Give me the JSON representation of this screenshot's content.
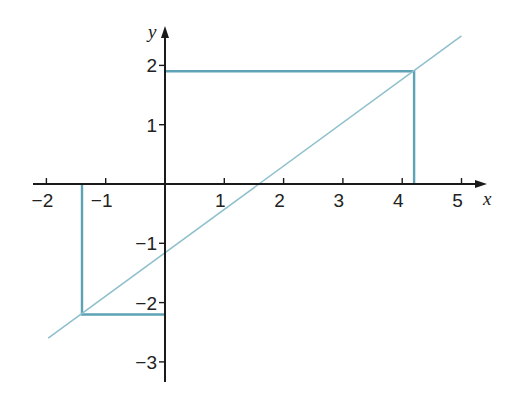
{
  "chart_data": {
    "type": "line",
    "title": "",
    "xlabel": "x",
    "ylabel": "y",
    "xlim": [
      -2.2,
      5.4
    ],
    "ylim": [
      -3.3,
      2.6
    ],
    "grid": false,
    "legend": null,
    "x_ticks": [
      -2,
      -1,
      1,
      2,
      3,
      4,
      5
    ],
    "x_tick_labels": [
      "−2",
      "−1",
      "1",
      "2",
      "3",
      "4",
      "5"
    ],
    "y_ticks": [
      2,
      1,
      -1,
      -2,
      -3
    ],
    "y_tick_labels": [
      "2",
      "1",
      "−1",
      "−2",
      "−3"
    ],
    "series": [
      {
        "name": "line",
        "kind": "line",
        "color": "#8fc0cc",
        "x": [
          -1.97,
          5.0
        ],
        "y": [
          -2.6,
          2.5
        ]
      },
      {
        "name": "guide-upper",
        "kind": "polyline",
        "color": "#5ea2b5",
        "x": [
          0,
          4.2,
          4.2
        ],
        "y": [
          1.9,
          1.9,
          0
        ]
      },
      {
        "name": "guide-lower",
        "kind": "polyline",
        "color": "#5ea2b5",
        "x": [
          -1.4,
          -1.4,
          0
        ],
        "y": [
          0,
          -2.2,
          -2.2
        ]
      }
    ],
    "annotations": {
      "line_x_intercept": 1.6,
      "line_y_intercept": -1.2
    }
  },
  "layout": {
    "origin_px": [
      165,
      184
    ],
    "unit_px": 59.3,
    "axis_color": "#1a1a1a",
    "x_axis_px": [
      33,
      487
    ],
    "y_axis_px": [
      26,
      382
    ]
  }
}
